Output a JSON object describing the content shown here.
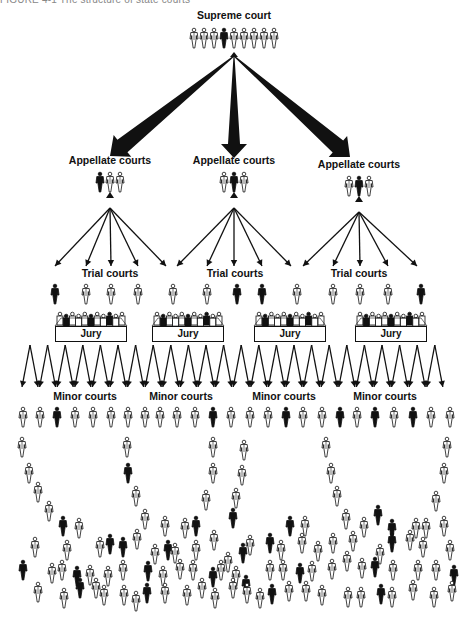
{
  "caption": "FIGURE 4-1   The structure of state courts",
  "colors": {
    "ink": "#111111",
    "background": "#ffffff",
    "caption": "#888888"
  },
  "supreme": {
    "label": "Supreme court",
    "label_pos": [
      234,
      16
    ],
    "figures": {
      "y": 28,
      "x": [
        194,
        204,
        214,
        224,
        234,
        244,
        254,
        264,
        274
      ],
      "filled": [
        false,
        false,
        false,
        true,
        false,
        false,
        false,
        false,
        false
      ]
    }
  },
  "appellate": [
    {
      "label": "Appellate courts",
      "label_pos": [
        110,
        160
      ],
      "figures": {
        "y": 172,
        "x": [
          100,
          110,
          120
        ],
        "filled": [
          true,
          false,
          false
        ]
      }
    },
    {
      "label": "Appellate courts",
      "label_pos": [
        234,
        160
      ],
      "figures": {
        "y": 172,
        "x": [
          224,
          234,
          244
        ],
        "filled": [
          false,
          true,
          false
        ]
      }
    },
    {
      "label": "Appellate courts",
      "label_pos": [
        359,
        164
      ],
      "figures": {
        "y": 176,
        "x": [
          349,
          359,
          369
        ],
        "filled": [
          false,
          true,
          false
        ]
      }
    }
  ],
  "trial": [
    {
      "label": "Trial courts",
      "label_pos": [
        110,
        274
      ]
    },
    {
      "label": "Trial courts",
      "label_pos": [
        235,
        274
      ]
    },
    {
      "label": "Trial courts",
      "label_pos": [
        359,
        274
      ]
    }
  ],
  "trial_figures": {
    "y": 284,
    "x": [
      55,
      86,
      111,
      138,
      173,
      207,
      237,
      262,
      297,
      333,
      360,
      388,
      421
    ],
    "filled": [
      true,
      false,
      false,
      false,
      false,
      false,
      true,
      true,
      false,
      false,
      false,
      false,
      true
    ]
  },
  "juries": [
    {
      "label": "Jury",
      "x": 55,
      "y": 326
    },
    {
      "label": "Jury",
      "x": 152,
      "y": 326
    },
    {
      "label": "Jury",
      "x": 254,
      "y": 326
    },
    {
      "label": "Jury",
      "x": 355,
      "y": 326
    }
  ],
  "minor": [
    {
      "label": "Minor courts",
      "label_pos": [
        85,
        395
      ]
    },
    {
      "label": "Minor courts",
      "label_pos": [
        181,
        395
      ]
    },
    {
      "label": "Minor courts",
      "label_pos": [
        284,
        395
      ]
    },
    {
      "label": "Minor courts",
      "label_pos": [
        385,
        395
      ]
    }
  ],
  "minor_figures": {
    "y": 407,
    "x": [
      23,
      40,
      57,
      75,
      93,
      111,
      128,
      145,
      160,
      177,
      195,
      213,
      231,
      250,
      268,
      286,
      303,
      322,
      340,
      357,
      375,
      394,
      413,
      431,
      450
    ],
    "filled": [
      false,
      false,
      true,
      false,
      false,
      false,
      false,
      false,
      false,
      false,
      false,
      true,
      false,
      false,
      false,
      true,
      false,
      false,
      true,
      false,
      true,
      false,
      true,
      false,
      false
    ]
  },
  "crowd": [
    [
      22,
      437,
      0
    ],
    [
      29,
      463,
      0
    ],
    [
      38,
      482,
      0
    ],
    [
      49,
      501,
      0
    ],
    [
      63,
      516,
      1
    ],
    [
      79,
      518,
      0
    ],
    [
      127,
      437,
      0
    ],
    [
      128,
      463,
      1
    ],
    [
      136,
      486,
      0
    ],
    [
      145,
      509,
      0
    ],
    [
      165,
      516,
      0
    ],
    [
      185,
      518,
      0
    ],
    [
      196,
      516,
      1
    ],
    [
      213,
      437,
      0
    ],
    [
      213,
      463,
      0
    ],
    [
      206,
      490,
      0
    ],
    [
      244,
      440,
      0
    ],
    [
      242,
      465,
      0
    ],
    [
      236,
      488,
      0
    ],
    [
      233,
      508,
      1
    ],
    [
      290,
      516,
      1
    ],
    [
      305,
      516,
      0
    ],
    [
      326,
      437,
      0
    ],
    [
      331,
      463,
      0
    ],
    [
      337,
      486,
      0
    ],
    [
      346,
      509,
      0
    ],
    [
      364,
      517,
      0
    ],
    [
      378,
      505,
      1
    ],
    [
      392,
      519,
      1
    ],
    [
      416,
      518,
      0
    ],
    [
      426,
      518,
      0
    ],
    [
      447,
      437,
      0
    ],
    [
      444,
      463,
      0
    ],
    [
      436,
      491,
      0
    ],
    [
      444,
      516,
      0
    ],
    [
      35,
      537,
      0
    ],
    [
      67,
      540,
      0
    ],
    [
      100,
      537,
      0
    ],
    [
      110,
      534,
      1
    ],
    [
      123,
      537,
      1
    ],
    [
      137,
      529,
      0
    ],
    [
      155,
      544,
      0
    ],
    [
      168,
      540,
      1
    ],
    [
      175,
      543,
      0
    ],
    [
      196,
      540,
      0
    ],
    [
      214,
      530,
      0
    ],
    [
      228,
      552,
      0
    ],
    [
      243,
      543,
      1
    ],
    [
      250,
      535,
      0
    ],
    [
      270,
      533,
      1
    ],
    [
      281,
      540,
      0
    ],
    [
      302,
      533,
      0
    ],
    [
      318,
      541,
      0
    ],
    [
      333,
      533,
      0
    ],
    [
      353,
      531,
      0
    ],
    [
      380,
      544,
      0
    ],
    [
      392,
      532,
      1
    ],
    [
      410,
      530,
      0
    ],
    [
      423,
      537,
      0
    ],
    [
      450,
      540,
      0
    ],
    [
      23,
      560,
      1
    ],
    [
      52,
      563,
      0
    ],
    [
      62,
      560,
      0
    ],
    [
      77,
      566,
      1
    ],
    [
      90,
      565,
      0
    ],
    [
      108,
      566,
      0
    ],
    [
      123,
      560,
      0
    ],
    [
      148,
      561,
      1
    ],
    [
      163,
      566,
      0
    ],
    [
      180,
      559,
      0
    ],
    [
      193,
      560,
      0
    ],
    [
      213,
      567,
      1
    ],
    [
      221,
      560,
      0
    ],
    [
      236,
      566,
      0
    ],
    [
      246,
      575,
      1
    ],
    [
      270,
      560,
      0
    ],
    [
      283,
      560,
      0
    ],
    [
      300,
      563,
      1
    ],
    [
      312,
      561,
      0
    ],
    [
      332,
      559,
      0
    ],
    [
      347,
      551,
      0
    ],
    [
      362,
      558,
      0
    ],
    [
      375,
      557,
      1
    ],
    [
      393,
      560,
      0
    ],
    [
      418,
      560,
      0
    ],
    [
      436,
      560,
      0
    ],
    [
      454,
      565,
      1
    ],
    [
      38,
      582,
      0
    ],
    [
      64,
      588,
      0
    ],
    [
      80,
      578,
      1
    ],
    [
      96,
      578,
      0
    ],
    [
      104,
      585,
      0
    ],
    [
      124,
      585,
      0
    ],
    [
      136,
      591,
      0
    ],
    [
      147,
      583,
      1
    ],
    [
      165,
      583,
      0
    ],
    [
      187,
      585,
      0
    ],
    [
      202,
      578,
      0
    ],
    [
      215,
      588,
      0
    ],
    [
      233,
      578,
      0
    ],
    [
      247,
      583,
      0
    ],
    [
      260,
      588,
      0
    ],
    [
      272,
      584,
      1
    ],
    [
      289,
      581,
      0
    ],
    [
      306,
      581,
      0
    ],
    [
      322,
      585,
      0
    ],
    [
      348,
      587,
      0
    ],
    [
      361,
      587,
      0
    ],
    [
      381,
      584,
      1
    ],
    [
      392,
      587,
      0
    ],
    [
      413,
      580,
      0
    ],
    [
      434,
      587,
      0
    ],
    [
      452,
      581,
      0
    ]
  ]
}
